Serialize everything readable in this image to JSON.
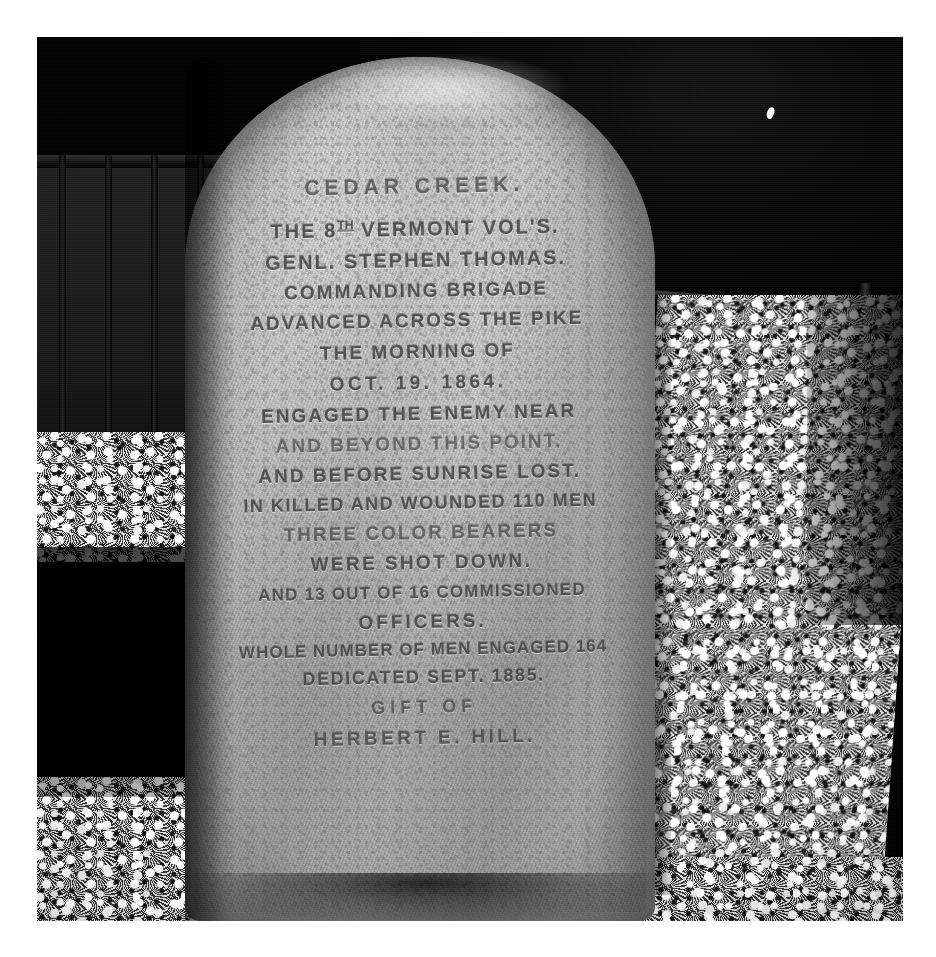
{
  "photo": {
    "subject": "Cedar Creek battlefield monument to the 8th Vermont Volunteers",
    "medium": "black-and-white photograph",
    "palette": {
      "paper": "#ffffff",
      "background_dark": "#0d0d0d",
      "stone_light": "#d7d5d0",
      "stone_mid": "#bcbab4",
      "stone_shadow": "#a5a39d",
      "carved_letter": "#4a4844",
      "gravel_light": "#fcfcfc",
      "gravel_dark": "#1e1e1e"
    }
  },
  "monument": {
    "material": "rough granite boulder with rounded top",
    "inscription": [
      {
        "id": "title",
        "text": "CEDAR CREEK."
      },
      {
        "id": "regiment",
        "text": "THE 8TH VERMONT VOL'S.",
        "has_superscript": true,
        "pre": "THE 8",
        "sup": "TH",
        "post": " VERMONT VOL'S."
      },
      {
        "id": "commander",
        "text": "GENL. STEPHEN THOMAS."
      },
      {
        "id": "role",
        "text": "COMMANDING BRIGADE"
      },
      {
        "id": "action1",
        "text": "ADVANCED ACROSS THE PIKE"
      },
      {
        "id": "action2",
        "text": "THE MORNING OF"
      },
      {
        "id": "date",
        "text": "OCT. 19. 1864."
      },
      {
        "id": "action3",
        "text": "ENGAGED THE ENEMY NEAR"
      },
      {
        "id": "action4",
        "text": "AND BEYOND THIS POINT."
      },
      {
        "id": "action5",
        "text": "AND BEFORE SUNRISE LOST."
      },
      {
        "id": "casualties",
        "text": "IN KILLED AND WOUNDED 110 MEN"
      },
      {
        "id": "colors1",
        "text": "THREE COLOR BEARERS"
      },
      {
        "id": "colors2",
        "text": "WERE SHOT DOWN."
      },
      {
        "id": "officers1",
        "text": "AND 13 OUT OF 16 COMMISSIONED"
      },
      {
        "id": "officers2",
        "text": "OFFICERS."
      },
      {
        "id": "strength",
        "text": "WHOLE NUMBER OF MEN ENGAGED 164"
      },
      {
        "id": "dedicated",
        "text": "DEDICATED SEPT. 1885."
      },
      {
        "id": "gift",
        "text": "GIFT OF"
      },
      {
        "id": "donor",
        "text": "HERBERT E. HILL."
      }
    ],
    "facts": {
      "battle": "Cedar Creek",
      "unit": "8th Vermont Volunteers",
      "brigade_commander": "Genl. Stephen Thomas",
      "battle_date": "Oct. 19. 1864",
      "killed_and_wounded": "110",
      "color_bearers_shot_down": "THREE",
      "officers_lost": "13",
      "officers_commissioned": "16",
      "total_engaged": "164",
      "dedication_date": "Sept. 1885",
      "donor": "Herbert E. Hill"
    }
  },
  "scene": {
    "background": "iron fence and dark shaded treeline",
    "ground": "white crushed-stone gravel",
    "fence_left": "iron fence with vertical bars",
    "rail_right": "dark rail and post",
    "speck": "small white speck in dark background"
  }
}
